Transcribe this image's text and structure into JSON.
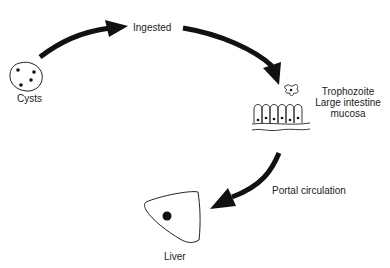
{
  "diagram": {
    "type": "life-cycle",
    "nodes": [
      {
        "id": "cysts",
        "label": "Cysts"
      },
      {
        "id": "ingested",
        "label": "Ingested"
      },
      {
        "id": "trophozoite",
        "label": "Trophozoite",
        "sublabel_1": "Large intestine",
        "sublabel_2": "mucosa"
      },
      {
        "id": "liver",
        "label": "Liver"
      }
    ],
    "edges": [
      {
        "from": "cysts",
        "to": "ingested",
        "label": ""
      },
      {
        "from": "ingested",
        "to": "trophozoite",
        "label": ""
      },
      {
        "from": "trophozoite",
        "to": "liver",
        "label": "Portal circulation"
      }
    ],
    "colors": {
      "arrow": "#111111",
      "line": "#222222",
      "background": "#ffffff"
    }
  }
}
